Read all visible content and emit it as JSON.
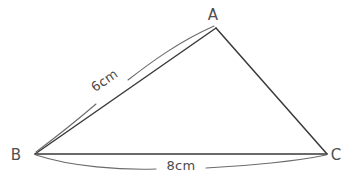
{
  "figure": {
    "type": "triangle-with-dimensions",
    "background_color": "#ffffff",
    "stroke_color": "#3a3a3a",
    "dimension_stroke_color": "#6b6b6b",
    "label_color": "#4f4f4f",
    "vertices": [
      {
        "id": "A",
        "label": "A",
        "x": 216,
        "y": 28,
        "label_x": 213,
        "label_y": 20
      },
      {
        "id": "B",
        "label": "B",
        "x": 35,
        "y": 154,
        "label_x": 16,
        "label_y": 160
      },
      {
        "id": "C",
        "label": "C",
        "x": 327,
        "y": 154,
        "label_x": 332,
        "label_y": 160
      }
    ],
    "sides": [
      {
        "id": "BA",
        "from": "B",
        "to": "A",
        "measure": "6cm",
        "labeled": true
      },
      {
        "id": "AC",
        "from": "A",
        "to": "C",
        "measure": "",
        "labeled": false
      },
      {
        "id": "BC",
        "from": "B",
        "to": "C",
        "measure": "8cm",
        "labeled": true
      }
    ],
    "measurements": [
      {
        "id": "side-ba-measure",
        "text": "6cm",
        "x": 107,
        "y": 84,
        "rotation": -34.8,
        "for_side": "BA"
      },
      {
        "id": "side-bc-measure",
        "text": "8cm",
        "x": 181,
        "y": 170,
        "rotation": 0,
        "for_side": "BC"
      }
    ]
  }
}
